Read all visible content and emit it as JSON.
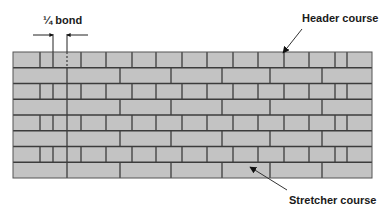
{
  "diagram": {
    "labels": {
      "quarter_bond": "¼ bond",
      "header_course": "Header course",
      "stretcher_course": "Stretcher course"
    },
    "colors": {
      "brick_fill": "#c3c3c3",
      "mortar": "#3c3c3c",
      "text": "#1a1a1a",
      "arrow": "#333333",
      "background": "#ffffff"
    },
    "wall": {
      "left": 13,
      "right": 372,
      "top": 52,
      "bottom": 178,
      "rows": 8,
      "row_pattern": [
        "header",
        "stretcher",
        "header",
        "stretcher",
        "header",
        "stretcher",
        "header",
        "stretcher"
      ],
      "header_joints": [
        40,
        53,
        81,
        106,
        132,
        156,
        182,
        207,
        233,
        258,
        284,
        309,
        335,
        347
      ],
      "header_dashed_joint": 67,
      "stretcher_joints": [
        67,
        120,
        171,
        222,
        270,
        322
      ]
    },
    "annotations": {
      "quarter_bond_marker": {
        "left_line_x": 53,
        "right_line_x": 67,
        "line_top": 34,
        "arrow_y": 35,
        "left_arrow_from": 33,
        "right_arrow_from": 88
      },
      "header_arrow": {
        "from": [
          302,
          29
        ],
        "to": [
          283,
          53
        ]
      },
      "stretcher_arrow": {
        "from": [
          287,
          190
        ],
        "to": [
          250,
          167
        ]
      }
    }
  }
}
